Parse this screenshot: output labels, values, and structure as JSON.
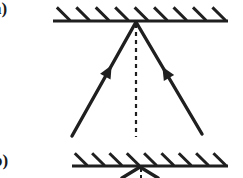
{
  "figure": {
    "width": 243,
    "height": 178,
    "background_color": "#ffffff",
    "ink_color": "#1f1f1f"
  },
  "panels": [
    {
      "id": "a",
      "label": "a)",
      "label_clipped": true,
      "surface": {
        "name": "hatched-mirror-surface",
        "line_y": 21,
        "x_start": 53,
        "x_end": 228,
        "line_width": 3.2,
        "hatch_count": 9,
        "hatch_side": "above",
        "hatch_direction": "down-right",
        "hatch_length": 17,
        "hatch_width": 3.0
      },
      "vertex": {
        "x": 136,
        "y": 22
      },
      "rays": [
        {
          "name": "incident-ray-left",
          "from_x": 72,
          "from_y": 136,
          "to_x": 136,
          "to_y": 22,
          "width": 3.4,
          "arrow": {
            "position": 0.62,
            "direction": "toward-vertex",
            "size": 13
          }
        },
        {
          "name": "incident-ray-right",
          "from_x": 202,
          "from_y": 134,
          "to_x": 136,
          "to_y": 22,
          "width": 3.4,
          "arrow": {
            "position": 0.6,
            "direction": "toward-vertex",
            "size": 13
          }
        }
      ],
      "normal": {
        "name": "normal-dashed-line",
        "x": 136,
        "y_start": 24,
        "y_end": 137,
        "style": "dashed",
        "dash": "4 4",
        "width": 2.2
      }
    },
    {
      "id": "b",
      "label": "b)",
      "label_clipped": true,
      "surface": {
        "name": "hatched-mirror-surface",
        "line_y": 166,
        "x_start": 72,
        "x_end": 228,
        "line_width": 3.2,
        "hatch_count": 9,
        "hatch_side": "above",
        "hatch_direction": "down-right",
        "hatch_length": 16,
        "hatch_width": 3.0
      },
      "vertex": {
        "x": 140,
        "y": 167
      },
      "rays": [
        {
          "name": "ray-left-clipped",
          "from_x": 140,
          "from_y": 167,
          "to_x": 122,
          "to_y": 178,
          "width": 3.4,
          "arrow": null
        },
        {
          "name": "ray-right-clipped",
          "from_x": 140,
          "from_y": 167,
          "to_x": 158,
          "to_y": 178,
          "width": 3.4,
          "arrow": null
        }
      ],
      "normal": {
        "name": "normal-dashed-line",
        "x": 141,
        "y_start": 169,
        "y_end": 178,
        "style": "dashed",
        "dash": "3 3",
        "width": 2.0
      }
    }
  ]
}
